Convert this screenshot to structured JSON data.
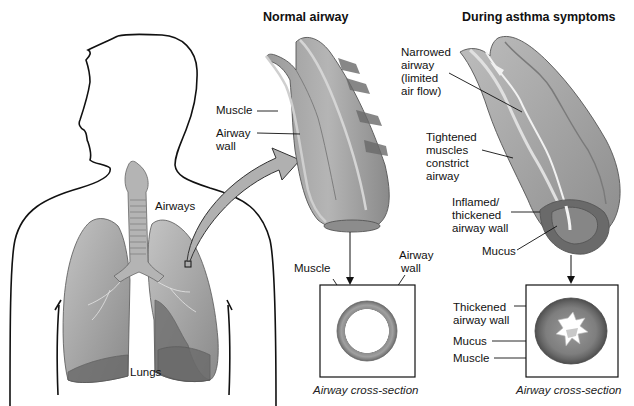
{
  "diagram": {
    "panels": {
      "normal": {
        "title": "Normal airway",
        "labels": {
          "muscle": "Muscle",
          "airway_wall_line1": "Airway",
          "airway_wall_line2": "wall"
        },
        "cross_section": {
          "caption": "Airway cross-section",
          "labels": {
            "muscle": "Muscle",
            "airway_wall_line1": "Airway",
            "airway_wall_line2": "wall"
          }
        }
      },
      "asthma": {
        "title": "During asthma symptoms",
        "labels": {
          "narrowed": [
            "Narrowed",
            "airway",
            "(limited",
            "air flow)"
          ],
          "tightened": [
            "Tightened",
            "muscles",
            "constrict",
            "airway"
          ],
          "inflamed": [
            "Inflamed/",
            "thickened",
            "airway wall"
          ],
          "mucus": "Mucus"
        },
        "cross_section": {
          "caption": "Airway cross-section",
          "labels": {
            "thickened_line1": "Thickened",
            "thickened_line2": "airway wall",
            "mucus": "Mucus",
            "muscle": "Muscle"
          }
        }
      },
      "body": {
        "labels": {
          "airways": "Airways",
          "lungs": "Lungs"
        }
      }
    },
    "colors": {
      "outline": "#111111",
      "tissue_light": "#b8b8b8",
      "tissue_mid": "#8e8e8e",
      "tissue_dark": "#5e5e5e",
      "muscle_band": "#6a6a6a",
      "arrow_fill": "#b0b0b0"
    }
  }
}
